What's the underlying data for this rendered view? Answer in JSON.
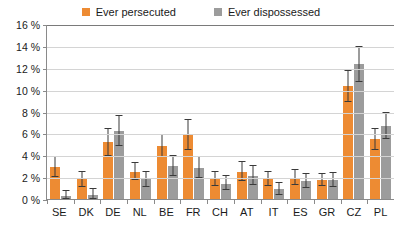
{
  "chart_data": {
    "type": "bar",
    "title": "",
    "subtitle": "",
    "xlabel": "",
    "ylabel": "",
    "ylim": [
      0,
      16
    ],
    "ytick_values": [
      0,
      2,
      4,
      6,
      8,
      10,
      12,
      14,
      16
    ],
    "ytick_labels": [
      "0 %",
      "2 %",
      "4 %",
      "6 %",
      "8 %",
      "10 %",
      "12 %",
      "14 %",
      "16 %"
    ],
    "grid": true,
    "legend_position": "top-center",
    "categories": [
      "SE",
      "DK",
      "DE",
      "NL",
      "BE",
      "FR",
      "CH",
      "AT",
      "IT",
      "ES",
      "GR",
      "CZ",
      "PL"
    ],
    "series": [
      {
        "name": "Ever persecuted",
        "color": "#ED8B33",
        "values": [
          3.0,
          1.9,
          5.3,
          2.6,
          4.9,
          6.0,
          1.9,
          2.6,
          1.9,
          2.0,
          1.8,
          10.4,
          5.6
        ],
        "err_low": [
          2.1,
          1.2,
          4.0,
          1.8,
          3.9,
          4.6,
          1.3,
          1.7,
          1.3,
          1.4,
          1.3,
          9.0,
          4.6
        ],
        "err_high": [
          3.9,
          2.6,
          6.5,
          3.4,
          5.9,
          7.3,
          2.6,
          3.5,
          2.6,
          2.7,
          2.4,
          11.8,
          6.5
        ]
      },
      {
        "name": "Ever dispossessed",
        "color": "#9C9C9C",
        "values": [
          0.4,
          0.5,
          6.3,
          1.9,
          3.1,
          2.9,
          1.5,
          2.2,
          1.0,
          1.7,
          1.8,
          12.4,
          6.8
        ],
        "err_low": [
          0.1,
          0.1,
          4.9,
          1.2,
          2.2,
          2.0,
          0.9,
          1.4,
          0.5,
          1.1,
          1.2,
          10.8,
          5.6
        ],
        "err_high": [
          0.8,
          1.0,
          7.7,
          2.6,
          4.0,
          3.9,
          2.2,
          3.1,
          1.6,
          2.4,
          2.5,
          14.0,
          8.0
        ]
      }
    ]
  },
  "legend": {
    "items": [
      {
        "label": "Ever persecuted",
        "color": "#ED8B33"
      },
      {
        "label": "Ever dispossessed",
        "color": "#9C9C9C"
      }
    ]
  }
}
